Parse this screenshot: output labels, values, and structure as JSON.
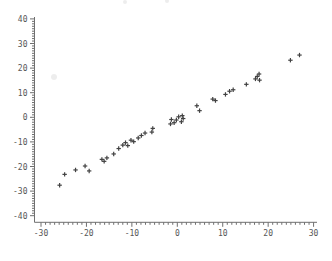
{
  "chart_data": {
    "type": "scatter",
    "title": "",
    "xlabel": "",
    "ylabel": "",
    "marker": "plus",
    "marker_color": "#2e2e2e",
    "axis_color": "#6f6f6f",
    "tick_label_color": "#565656",
    "background_color": "#ffffff",
    "xlim": [
      -30,
      30
    ],
    "ylim": [
      -40,
      40
    ],
    "x_ticks": [
      -30,
      -20,
      -10,
      0,
      10,
      20,
      30
    ],
    "y_ticks": [
      40,
      30,
      20,
      10,
      0,
      -10,
      -20,
      -30,
      -40
    ],
    "minor_tick_step_x": 1,
    "minor_tick_step_y": 1,
    "grid": false,
    "legend": null,
    "points": [
      [
        -25.9,
        -27.6
      ],
      [
        -24.8,
        -23.2
      ],
      [
        -22.4,
        -21.4
      ],
      [
        -20.3,
        -19.8
      ],
      [
        -19.4,
        -21.8
      ],
      [
        -16.6,
        -17.1
      ],
      [
        -16.1,
        -17.9
      ],
      [
        -15.5,
        -16.5
      ],
      [
        -14.0,
        -14.9
      ],
      [
        -12.9,
        -12.7
      ],
      [
        -12.0,
        -11.3
      ],
      [
        -11.4,
        -10.3
      ],
      [
        -10.9,
        -11.5
      ],
      [
        -10.2,
        -9.3
      ],
      [
        -9.6,
        -9.9
      ],
      [
        -8.6,
        -8.4
      ],
      [
        -7.9,
        -7.4
      ],
      [
        -7.1,
        -6.4
      ],
      [
        -5.6,
        -6.0
      ],
      [
        -5.4,
        -4.5
      ],
      [
        -1.5,
        -2.7
      ],
      [
        -1.3,
        -0.9
      ],
      [
        -0.7,
        -2.2
      ],
      [
        -0.2,
        -1.1
      ],
      [
        0.3,
        0.2
      ],
      [
        0.9,
        -1.8
      ],
      [
        1.3,
        -0.5
      ],
      [
        1.1,
        0.7
      ],
      [
        4.3,
        4.7
      ],
      [
        4.9,
        2.7
      ],
      [
        7.8,
        7.4
      ],
      [
        8.4,
        6.8
      ],
      [
        10.6,
        9.3
      ],
      [
        11.5,
        10.6
      ],
      [
        12.3,
        11.2
      ],
      [
        15.2,
        13.4
      ],
      [
        17.2,
        15.6
      ],
      [
        18.1,
        15.1
      ],
      [
        17.6,
        16.6
      ],
      [
        18.0,
        17.6
      ],
      [
        24.9,
        23.2
      ],
      [
        26.9,
        25.3
      ]
    ]
  },
  "scan_artifacts": {
    "color": "#e9e9e9",
    "smudges": [
      {
        "x_px": 54,
        "y_px": 77,
        "r": 3
      },
      {
        "x_px": 125,
        "y_px": 2,
        "r": 2
      },
      {
        "x_px": 167,
        "y_px": 1,
        "r": 2
      }
    ]
  }
}
